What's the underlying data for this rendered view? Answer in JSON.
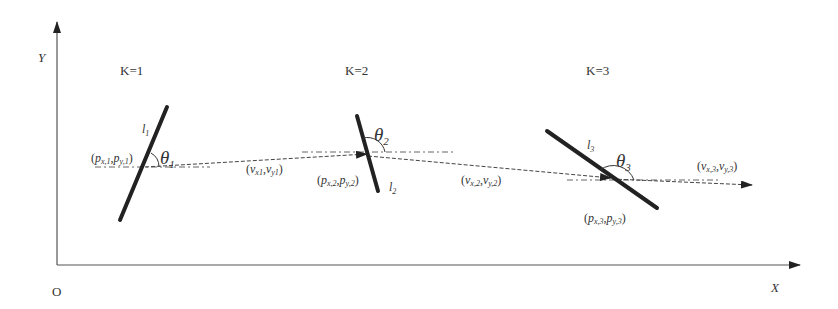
{
  "axes": {
    "origin_label": "O",
    "x_label": "X",
    "y_label": "Y"
  },
  "stages": [
    {
      "k_label": "K=1",
      "line_label": "l",
      "line_sub": "1",
      "angle_label": "θ",
      "angle_sub": "1",
      "point_label": "(p",
      "point_label_full": "(px,1,py,1)",
      "velocity_label_full": "(vx1,vy1)"
    },
    {
      "k_label": "K=2",
      "line_label": "l",
      "line_sub": "2",
      "angle_label": "θ",
      "angle_sub": "2",
      "point_label_full": "(px,2,py,2)",
      "velocity_label_full": "(vx,2,vy,2)"
    },
    {
      "k_label": "K=3",
      "line_label": "l",
      "line_sub": "3",
      "angle_label": "θ",
      "angle_sub": "3",
      "point_label_full": "(px,3,py,3)",
      "velocity_label_full": "(vx,3,vy,3)"
    }
  ],
  "text": {
    "p": "p",
    "v": "v",
    "x": "x",
    "y": "y",
    "open": "(",
    "close": ")",
    "comma": ",",
    "sub_x1": "x,1",
    "sub_y1": "y,1",
    "sub_x2": "x,2",
    "sub_y2": "y,2",
    "sub_x3": "x,3",
    "sub_y3": "y,3",
    "sub_vx1": "x1",
    "sub_vy1": "y1"
  },
  "colors": {
    "stroke": "#222222",
    "axis": "#444444",
    "dash": "#555555"
  }
}
